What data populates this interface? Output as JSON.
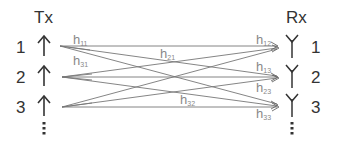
{
  "diagram": {
    "tx_title": "Tx",
    "rx_title": "Rx",
    "tx_antennas": [
      {
        "label": "1",
        "y": 46
      },
      {
        "label": "2",
        "y": 77
      },
      {
        "label": "3",
        "y": 107
      }
    ],
    "rx_antennas": [
      {
        "label": "1",
        "y": 47
      },
      {
        "label": "2",
        "y": 77
      },
      {
        "label": "3",
        "y": 105
      }
    ],
    "continuation": "⋮",
    "channel_labels": {
      "h11": {
        "base": "h",
        "sub": "11"
      },
      "h31": {
        "base": "h",
        "sub": "31"
      },
      "h21": {
        "base": "h",
        "sub": "21"
      },
      "h12": {
        "base": "h",
        "sub": "12"
      },
      "h13": {
        "base": "h",
        "sub": "13"
      },
      "h23": {
        "base": "h",
        "sub": "23"
      },
      "h32": {
        "base": "h",
        "sub": "32"
      },
      "h33": {
        "base": "h",
        "sub": "33"
      }
    },
    "colors": {
      "text": "#333333",
      "channel_label": "#888888",
      "lines": "#777777"
    }
  }
}
